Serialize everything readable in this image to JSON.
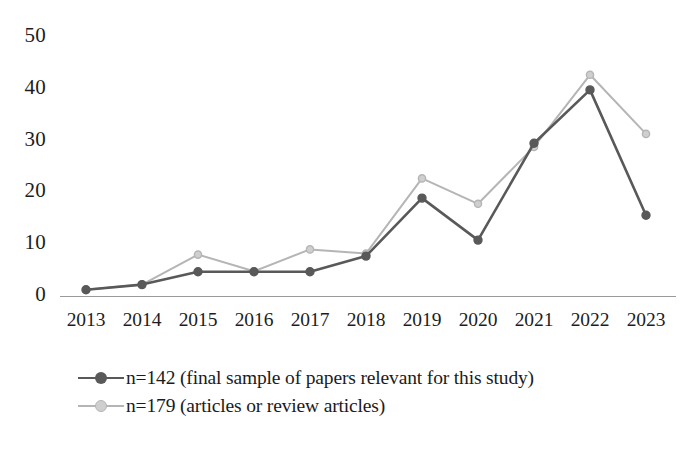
{
  "chart_data": {
    "type": "line",
    "title": "",
    "xlabel": "",
    "ylabel": "",
    "categories": [
      "2013",
      "2014",
      "2015",
      "2016",
      "2017",
      "2018",
      "2019",
      "2020",
      "2021",
      "2022",
      "2023"
    ],
    "ylim": [
      0,
      50
    ],
    "yticks": [
      "0",
      "10",
      "20",
      "30",
      "40",
      "50"
    ],
    "grid": false,
    "legend_position": "bottom-left",
    "series": [
      {
        "name": "n=142 (final sample of papers relevant for this study)",
        "color": "#595959",
        "marker": "circle",
        "values": [
          1,
          2,
          4.5,
          4.5,
          4.5,
          7.5,
          18.7,
          10.6,
          29.3,
          39.6,
          15.4
        ]
      },
      {
        "name": "n=179 (articles or review articles)",
        "color": "#b5b5b5",
        "marker": "circle",
        "values": [
          1,
          2,
          7.8,
          4.6,
          8.8,
          8.0,
          22.5,
          17.6,
          28.6,
          42.5,
          31.1
        ]
      }
    ]
  },
  "axes": {
    "y_ticks": [
      {
        "label": "50",
        "value": 50
      },
      {
        "label": "40",
        "value": 40
      },
      {
        "label": "30",
        "value": 30
      },
      {
        "label": "20",
        "value": 20
      },
      {
        "label": "10",
        "value": 10
      },
      {
        "label": "0",
        "value": 0
      }
    ],
    "x_ticks": [
      {
        "label": "2013"
      },
      {
        "label": "2014"
      },
      {
        "label": "2015"
      },
      {
        "label": "2016"
      },
      {
        "label": "2017"
      },
      {
        "label": "2018"
      },
      {
        "label": "2019"
      },
      {
        "label": "2020"
      },
      {
        "label": "2021"
      },
      {
        "label": "2022"
      },
      {
        "label": "2023"
      }
    ]
  },
  "legend": {
    "entries": [
      {
        "label": "n=142 (final sample of papers relevant for this study)",
        "color": "#595959"
      },
      {
        "label": "n=179 (articles or review articles)",
        "color": "#b5b5b5"
      }
    ]
  },
  "colors": {
    "series_dark": "#595959",
    "series_light": "#b5b5b5",
    "axis_line": "#9a9a9a",
    "text": "#1b1b1b",
    "background": "#ffffff"
  }
}
